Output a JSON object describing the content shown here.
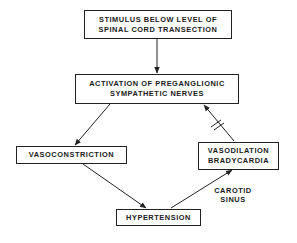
{
  "diagram": {
    "nodes": [
      {
        "id": "stimulus",
        "lines": [
          "STIMULUS BELOW LEVEL OF",
          "SPINAL CORD TRANSECTION"
        ]
      },
      {
        "id": "activation",
        "lines": [
          "ACTIVATION OF PREGANGLIONIC",
          "SYMPATHETIC NERVES"
        ]
      },
      {
        "id": "vasoconstriction",
        "lines": [
          "VASOCONSTRICTION"
        ]
      },
      {
        "id": "vasodilation",
        "lines": [
          "VASODILATION",
          "BRADYCARDIA"
        ]
      },
      {
        "id": "hypertension",
        "lines": [
          "HYPERTENSION"
        ]
      }
    ],
    "edge_labels": {
      "carotid_sinus": [
        "CAROTID",
        "SINUS"
      ]
    },
    "edges": [
      {
        "from": "stimulus",
        "to": "activation",
        "type": "arrow"
      },
      {
        "from": "activation",
        "to": "vasoconstriction",
        "type": "arrow"
      },
      {
        "from": "vasoconstriction",
        "to": "hypertension",
        "type": "arrow"
      },
      {
        "from": "hypertension",
        "to": "vasodilation",
        "type": "arrow",
        "label": "CAROTID SINUS"
      },
      {
        "from": "vasodilation",
        "to": "activation",
        "type": "inhibitory-arrow"
      }
    ]
  }
}
